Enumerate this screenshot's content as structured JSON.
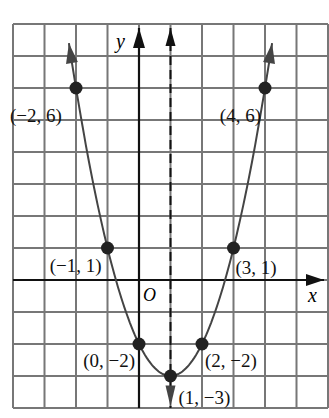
{
  "chart_data": {
    "type": "line",
    "title": "",
    "function": "y = x^2 - 2x - 2",
    "xlabel": "x",
    "ylabel": "y",
    "origin_label": "O",
    "xlim": [
      -4,
      6
    ],
    "ylim": [
      -4,
      8
    ],
    "grid": true,
    "axis_of_symmetry": {
      "x": 1,
      "style": "dashed"
    },
    "points": [
      {
        "x": -2,
        "y": 6,
        "label": "(−2, 6)"
      },
      {
        "x": -1,
        "y": 1,
        "label": "(−1, 1)"
      },
      {
        "x": 0,
        "y": -2,
        "label": "(0, −2)"
      },
      {
        "x": 1,
        "y": -3,
        "label": "(1, −3)"
      },
      {
        "x": 2,
        "y": -2,
        "label": "(2, −2)"
      },
      {
        "x": 3,
        "y": 1,
        "label": "(3, 1)"
      },
      {
        "x": 4,
        "y": 6,
        "label": "(4, 6)"
      }
    ]
  },
  "colors": {
    "grid": "#777777",
    "axis": "#111111",
    "curve": "#444444",
    "point": "#222222",
    "background": "#ffffff"
  }
}
